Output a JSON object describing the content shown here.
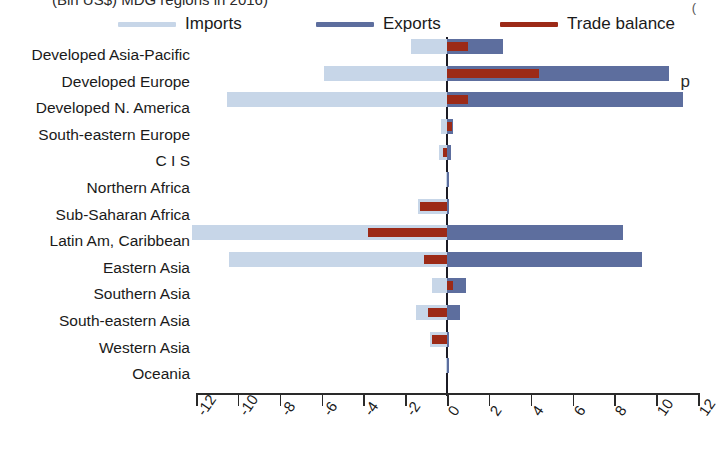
{
  "title_partial": "(Bln US$) MDG regions in 2016)",
  "right_margin_glyph": "p",
  "corner_glyph": "(",
  "legend": {
    "items": [
      {
        "label": "Imports",
        "color": "#c7d6e8",
        "name": "legend-imports"
      },
      {
        "label": "Exports",
        "color": "#5d6e9e",
        "name": "legend-exports"
      },
      {
        "label": "Trade balance",
        "color": "#9c2a17",
        "name": "legend-balance"
      }
    ]
  },
  "axis": {
    "ticks": [
      "-12",
      "-10",
      "-8",
      "-6",
      "-4",
      "-2",
      "0",
      "2",
      "4",
      "6",
      "8",
      "10",
      "12"
    ],
    "min": -12,
    "max": 12
  },
  "chart_data": {
    "type": "bar",
    "orientation": "horizontal",
    "title": "(Bln US$) MDG regions in 2016)",
    "xlabel": "",
    "ylabel": "",
    "xlim": [
      -12,
      12
    ],
    "grid": false,
    "legend_position": "top",
    "categories": [
      "Developed Asia-Pacific",
      "Developed Europe",
      "Developed N. America",
      "South-eastern Europe",
      "C I S",
      "Northern Africa",
      "Sub-Saharan Africa",
      "Latin Am, Caribbean",
      "Eastern Asia",
      "Southern Asia",
      "South-eastern Asia",
      "Western Asia",
      "Oceania"
    ],
    "series": [
      {
        "name": "Imports",
        "color": "#c7d6e8",
        "values": [
          -1.7,
          -5.9,
          -10.5,
          -0.3,
          -0.4,
          -0.05,
          -1.4,
          -12.2,
          -10.4,
          -0.7,
          -1.5,
          -0.8,
          -0.05
        ]
      },
      {
        "name": "Exports",
        "color": "#5d6e9e",
        "values": [
          2.7,
          10.6,
          11.3,
          0.3,
          0.2,
          0.05,
          0.1,
          8.4,
          9.3,
          0.9,
          0.6,
          0.1,
          0.05
        ]
      },
      {
        "name": "Trade balance",
        "color": "#9c2a17",
        "values": [
          1.0,
          4.4,
          1.0,
          0.25,
          -0.2,
          0.0,
          -1.3,
          -3.8,
          -1.1,
          0.3,
          -0.9,
          -0.7,
          0.0
        ]
      }
    ]
  }
}
